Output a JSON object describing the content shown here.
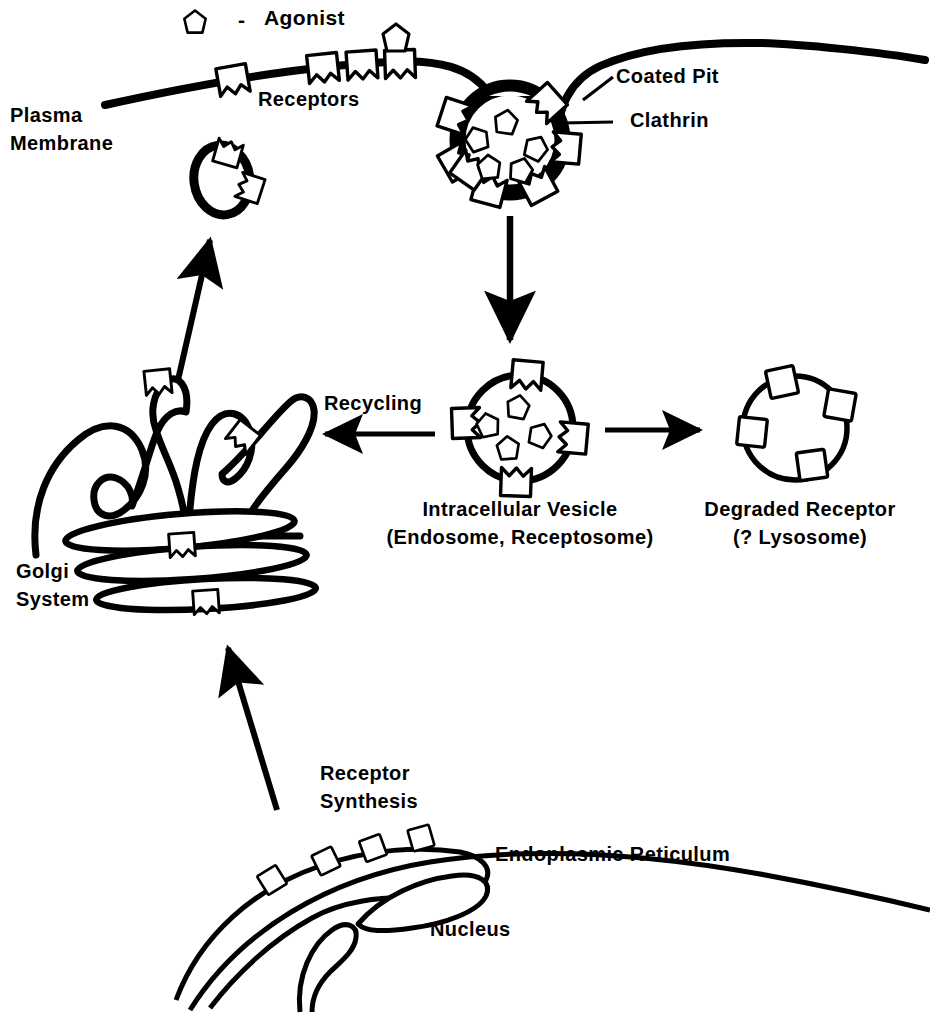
{
  "figure": {
    "type": "cell-biology-diagram",
    "background_color": "#ffffff",
    "ink_color": "#000000"
  },
  "legend": {
    "symbol_name": "agonist-pentagon",
    "dash": "-",
    "label": "Agonist"
  },
  "labels": {
    "plasma_membrane_line1": "Plasma",
    "plasma_membrane_line2": "Membrane",
    "receptors": "Receptors",
    "coated_pit": "Coated Pit",
    "clathrin": "Clathrin",
    "recycling": "Recycling",
    "intracellular_vesicle_line1": "Intracellular Vesicle",
    "intracellular_vesicle_line2": "(Endosome, Receptosome)",
    "degraded_receptor_line1": "Degraded Receptor",
    "degraded_receptor_line2": "(? Lysosome)",
    "golgi_line1": "Golgi",
    "golgi_line2": "System",
    "receptor_synthesis_line1": "Receptor",
    "receptor_synthesis_line2": "Synthesis",
    "endoplasmic_reticulum": "Endoplasmic Reticulum",
    "nucleus": "Nucleus"
  },
  "structures": [
    {
      "name": "plasma-membrane",
      "description": "Thick curved line across the top of the figure that dips into a coated pit"
    },
    {
      "name": "coated-pit",
      "description": "Invaginated pit with thick clathrin coat, 7 membrane receptors and 5 bound agonists"
    },
    {
      "name": "intracellular-vesicle",
      "description": "Round vesicle with 4 receptors in the membrane and 4 agonists inside"
    },
    {
      "name": "degraded-receptor-vesicle",
      "description": "Round vesicle with 4 plain receptor squares and no agonist"
    },
    {
      "name": "recycling-vesicle",
      "description": "Small oval vesicle with 2 receptors, travelling back to the plasma membrane"
    },
    {
      "name": "golgi-system",
      "description": "Stack of flattened cisternae with two upward projections bearing receptors"
    },
    {
      "name": "endoplasmic-reticulum",
      "description": "Elongated cisternae studded with 4 newly synthesized receptors"
    },
    {
      "name": "nucleus",
      "description": "Large curved boundary at the bottom of the figure"
    }
  ],
  "arrows": [
    {
      "name": "arrow-coated-pit-to-vesicle",
      "from": "coated-pit",
      "to": "intracellular-vesicle",
      "direction": "down"
    },
    {
      "name": "arrow-vesicle-to-degraded",
      "from": "intracellular-vesicle",
      "to": "degraded-receptor-vesicle",
      "direction": "right"
    },
    {
      "name": "arrow-vesicle-to-golgi",
      "from": "intracellular-vesicle",
      "to": "golgi-system",
      "direction": "left",
      "label": "Recycling"
    },
    {
      "name": "arrow-golgi-to-membrane",
      "from": "golgi-system",
      "to": "recycling-vesicle",
      "direction": "up"
    },
    {
      "name": "arrow-er-to-golgi",
      "from": "endoplasmic-reticulum",
      "to": "golgi-system",
      "direction": "up"
    }
  ],
  "leaders": [
    {
      "name": "leader-coated-pit",
      "target": "coated-pit"
    },
    {
      "name": "leader-clathrin",
      "target": "clathrin-coat"
    }
  ],
  "counts": {
    "plasma_membrane_receptors": 4,
    "free_agonists_at_membrane": 1,
    "coated_pit_receptors": 7,
    "coated_pit_agonists": 5,
    "intracellular_vesicle_receptors": 4,
    "intracellular_vesicle_agonists": 4,
    "degraded_receptor_squares": 4,
    "recycling_vesicle_receptors": 2,
    "golgi_receptors": 4,
    "er_receptors": 4
  }
}
